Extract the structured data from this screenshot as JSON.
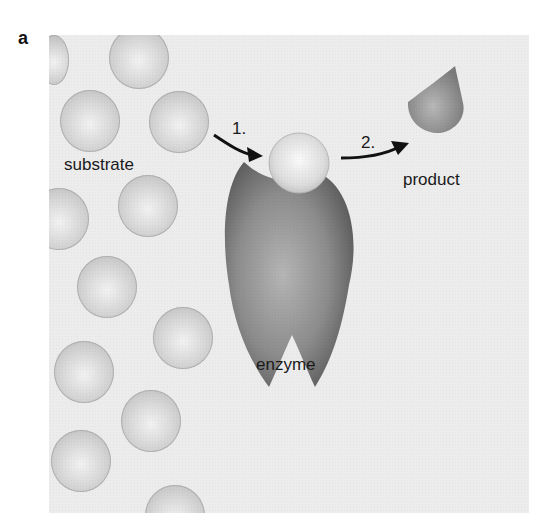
{
  "figure": {
    "panel_label": "a",
    "labels": {
      "substrate": "substrate",
      "enzyme": "enzyme",
      "product": "product"
    },
    "steps": [
      {
        "label": "1.",
        "description": "substrate binds enzyme"
      },
      {
        "label": "2.",
        "description": "product released"
      }
    ],
    "colors": {
      "background": "#ececec",
      "substrate": "#d0d0d0",
      "enzyme": "#8a8a8a",
      "product": "#9a9a9a",
      "arrow": "#111111"
    }
  }
}
